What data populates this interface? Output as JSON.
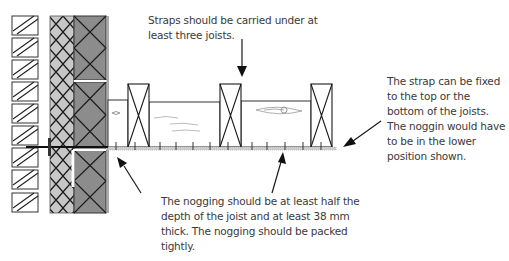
{
  "diagram": {
    "annotations": {
      "straps": "Straps should be carried under at least three joists.",
      "strap_fix": "The strap can be fixed to the top or the bottom of the joists. The noggin would have to be in the lower position shown.",
      "nogging": "The nogging should be at least half the depth of the joist and at least 38 mm thick. The nogging should be packed tightly."
    },
    "components": [
      "external-brick-leaf",
      "cavity-insulation",
      "internal-block-leaf",
      "joists",
      "noggings",
      "restraint-strap"
    ],
    "colors": {
      "block_fill": "#8c8c8c",
      "insulation_fill": "#c8c8c8",
      "line": "#1a1a1a",
      "strap": "#bdbdbd"
    }
  }
}
